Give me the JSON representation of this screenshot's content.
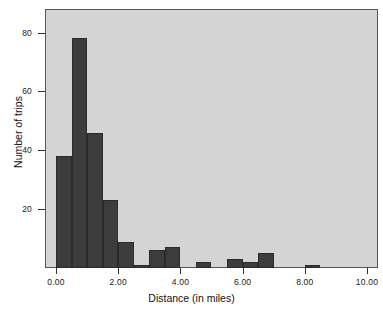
{
  "chart_data": {
    "type": "bar",
    "title": "",
    "xlabel": "Distance (in miles)",
    "ylabel": "Number of trips",
    "xlim": [
      -0.45,
      10.3
    ],
    "ylim": [
      0,
      88
    ],
    "grid": false,
    "legend": "none",
    "bin_width": 0.5,
    "xticks": [
      "0.00",
      "2.00",
      "4.00",
      "6.00",
      "8.00",
      "10.00"
    ],
    "xtick_values": [
      0,
      2,
      4,
      6,
      8,
      10
    ],
    "yticks": [
      "20",
      "40",
      "60",
      "80"
    ],
    "ytick_values": [
      20,
      40,
      60,
      80
    ],
    "bin_starts": [
      0.0,
      0.5,
      1.0,
      1.5,
      2.0,
      2.5,
      3.0,
      3.5,
      4.5,
      5.5,
      6.0,
      6.5,
      8.0
    ],
    "values": [
      38,
      78,
      46,
      23,
      9,
      1,
      6,
      7,
      2,
      3,
      2,
      5,
      1
    ],
    "colors": {
      "bar_fill": "#3c3c3c",
      "bar_edge": "#2a2a2a",
      "plot_background": "#d4d4d4",
      "axis": "#555555",
      "text": "#111111",
      "page_background": "#ffffff"
    }
  }
}
